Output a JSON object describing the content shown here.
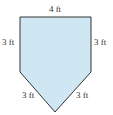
{
  "figure": {
    "shape": "pentagon",
    "fill_color": "#cfe6f3",
    "stroke_color": "#333333",
    "labels": {
      "top": "4 ft",
      "left": "3 ft",
      "right": "3 ft",
      "bottom_left": "3 ft",
      "bottom_right": "3 ft"
    }
  }
}
